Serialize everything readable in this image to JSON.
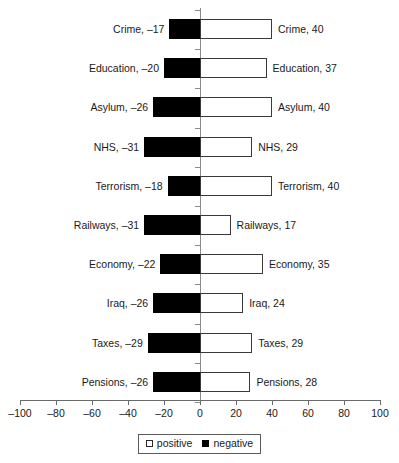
{
  "chart_data": {
    "type": "bar",
    "title": "",
    "subtitle": "",
    "xlabel": "",
    "ylabel": "",
    "orientation": "horizontal",
    "style": "diverging-bidirectional",
    "xlim": [
      -100,
      100
    ],
    "xticks": [
      -100,
      -80,
      -60,
      -40,
      -20,
      0,
      20,
      40,
      60,
      80,
      100
    ],
    "xtick_labels": [
      "–100",
      "–80",
      "–60",
      "–40",
      "–20",
      "0",
      "20",
      "40",
      "60",
      "80",
      "100"
    ],
    "grid": false,
    "legend_position": "bottom-center",
    "categories": [
      "Crime",
      "Education",
      "Asylum",
      "NHS",
      "Terrorism",
      "Railways",
      "Economy",
      "Iraq",
      "Taxes",
      "Pensions"
    ],
    "series": [
      {
        "name": "negative",
        "color": "#000000",
        "values": [
          -17,
          -20,
          -26,
          -31,
          -18,
          -31,
          -22,
          -26,
          -29,
          -26
        ]
      },
      {
        "name": "positive",
        "color": "#ffffff",
        "values": [
          40,
          37,
          40,
          29,
          40,
          17,
          35,
          24,
          29,
          28
        ]
      }
    ],
    "rows": [
      {
        "category": "Crime",
        "negative": -17,
        "positive": 40,
        "left_label": "Crime, –17",
        "right_label": "Crime, 40"
      },
      {
        "category": "Education",
        "negative": -20,
        "positive": 37,
        "left_label": "Education, –20",
        "right_label": "Education, 37"
      },
      {
        "category": "Asylum",
        "negative": -26,
        "positive": 40,
        "left_label": "Asylum, –26",
        "right_label": "Asylum, 40"
      },
      {
        "category": "NHS",
        "negative": -31,
        "positive": 29,
        "left_label": "NHS, –31",
        "right_label": "NHS, 29"
      },
      {
        "category": "Terrorism",
        "negative": -18,
        "positive": 40,
        "left_label": "Terrorism, –18",
        "right_label": "Terrorism, 40"
      },
      {
        "category": "Railways",
        "negative": -31,
        "positive": 17,
        "left_label": "Railways, –31",
        "right_label": "Railways, 17"
      },
      {
        "category": "Economy",
        "negative": -22,
        "positive": 35,
        "left_label": "Economy, –22",
        "right_label": "Economy, 35"
      },
      {
        "category": "Iraq",
        "negative": -26,
        "positive": 24,
        "left_label": "Iraq, –26",
        "right_label": "Iraq, 24"
      },
      {
        "category": "Taxes",
        "negative": -29,
        "positive": 29,
        "left_label": "Taxes, –29",
        "right_label": "Taxes, 29"
      },
      {
        "category": "Pensions",
        "negative": -26,
        "positive": 28,
        "left_label": "Pensions, –26",
        "right_label": "Pensions, 28"
      }
    ],
    "legend": [
      {
        "label": "positive",
        "swatch": "positive"
      },
      {
        "label": "negative",
        "swatch": "negative"
      }
    ]
  }
}
